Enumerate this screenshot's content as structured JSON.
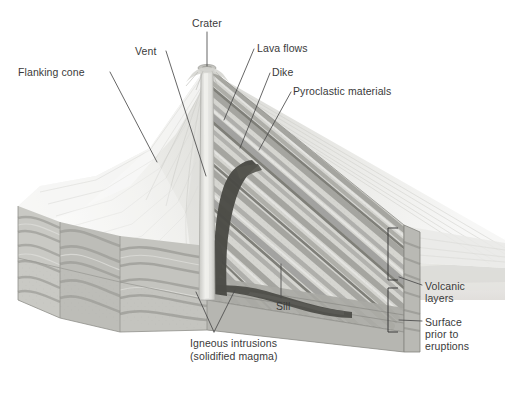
{
  "figure": {
    "kind": "geological-block-diagram",
    "canvas": {
      "width": 505,
      "height": 406
    },
    "background_color": "#ffffff",
    "text_color": "#3a3a3a",
    "leader_color": "#4a4a4a"
  },
  "palette": {
    "paper_white": "#ffffff",
    "snow_light": "#efefec",
    "layer_light": "#dcdcd8",
    "layer_mid": "#b4b4af",
    "layer_gray": "#9a9a95",
    "layer_dark": "#6e6e69",
    "intrusion_dark": "#44443f",
    "conduit_light": "#e4e4e0",
    "front_face": "#c9c9c4",
    "side_face": "#b0b0ab",
    "distant_haze": "#e8e8e6",
    "outline": "#8a8a85"
  },
  "labels": [
    {
      "id": "flanking-cone",
      "text": "Flanking cone",
      "x": 18,
      "y": 66,
      "align": "left"
    },
    {
      "id": "vent",
      "text": "Vent",
      "x": 135,
      "y": 45,
      "align": "left"
    },
    {
      "id": "crater",
      "text": "Crater",
      "x": 192,
      "y": 17,
      "align": "left"
    },
    {
      "id": "lava-flows",
      "text": "Lava flows",
      "x": 257,
      "y": 42,
      "align": "left"
    },
    {
      "id": "dike",
      "text": "Dike",
      "x": 272,
      "y": 66,
      "align": "left"
    },
    {
      "id": "pyroclastic-materials",
      "text": "Pyroclastic materials",
      "x": 293,
      "y": 85,
      "align": "left"
    },
    {
      "id": "volcanic-layers-1",
      "text": "Volcanic",
      "x": 425,
      "y": 280,
      "align": "left"
    },
    {
      "id": "volcanic-layers-2",
      "text": "layers",
      "x": 425,
      "y": 292,
      "align": "left"
    },
    {
      "id": "surface-prior-1",
      "text": "Surface",
      "x": 425,
      "y": 316,
      "align": "left"
    },
    {
      "id": "surface-prior-2",
      "text": "prior to",
      "x": 425,
      "y": 328,
      "align": "left"
    },
    {
      "id": "surface-prior-3",
      "text": "eruptions",
      "x": 425,
      "y": 340,
      "align": "left"
    },
    {
      "id": "sill",
      "text": "Sill",
      "x": 276,
      "y": 300,
      "align": "left"
    },
    {
      "id": "igneous-intrusions-1",
      "text": "Igneous intrusions",
      "x": 190,
      "y": 337,
      "align": "left"
    },
    {
      "id": "igneous-intrusions-2",
      "text": "(solidified magma)",
      "x": 190,
      "y": 350,
      "align": "left"
    }
  ],
  "leader_lines": [
    {
      "id": "leader-flanking-cone",
      "from": [
        110,
        72
      ],
      "to": [
        157,
        162
      ]
    },
    {
      "id": "leader-vent",
      "from": [
        166,
        51
      ],
      "to": [
        206,
        174
      ]
    },
    {
      "id": "leader-crater",
      "from": [
        207,
        32
      ],
      "to": [
        207,
        67
      ]
    },
    {
      "id": "leader-lava-flows",
      "from": [
        253,
        49
      ],
      "to": [
        224,
        120
      ]
    },
    {
      "id": "leader-dike",
      "from": [
        269,
        73
      ],
      "to": [
        239,
        147
      ]
    },
    {
      "id": "leader-pyroclastic",
      "from": [
        290,
        92
      ],
      "to": [
        258,
        150
      ]
    },
    {
      "id": "leader-volcanic-layers",
      "from": [
        422,
        286
      ],
      "to": [
        398,
        277
      ]
    },
    {
      "id": "leader-surface-prior",
      "from": [
        422,
        322
      ],
      "to": [
        398,
        320
      ]
    },
    {
      "id": "leader-sill",
      "from": [
        281,
        298
      ],
      "to": [
        281,
        266
      ]
    },
    {
      "id": "leader-igneous-a",
      "from": [
        214,
        332
      ],
      "to": [
        196,
        291
      ]
    },
    {
      "id": "leader-igneous-b",
      "from": [
        214,
        332
      ],
      "to": [
        234,
        290
      ]
    }
  ],
  "brackets": [
    {
      "id": "bracket-volcanic-layers",
      "x": 388,
      "y": 228,
      "width": 10,
      "height": 52
    },
    {
      "id": "bracket-surface-prior",
      "x": 388,
      "y": 288,
      "width": 10,
      "height": 44
    }
  ],
  "structures": [
    {
      "id": "central-conduit",
      "name": "Vent / central conduit",
      "color": "#e4e4e0"
    },
    {
      "id": "crater-summit",
      "name": "Summit crater",
      "color": "#cfcfca"
    },
    {
      "id": "flanking-cone-slope",
      "name": "Flanking cone",
      "color": "#e6e6e2"
    },
    {
      "id": "layered-strata",
      "name": "Alternating lava flows and pyroclastic layers",
      "color": "#b4b4af"
    },
    {
      "id": "dike-intrusion",
      "name": "Dike",
      "color": "#44443f"
    },
    {
      "id": "sill-intrusion",
      "name": "Sill",
      "color": "#44443f"
    },
    {
      "id": "pre-eruption-surface",
      "name": "Surface prior to eruptions",
      "color": "#9a9a95"
    },
    {
      "id": "basement-strata",
      "name": "Pre-existing sedimentary strata",
      "color": "#c9c9c4"
    }
  ]
}
